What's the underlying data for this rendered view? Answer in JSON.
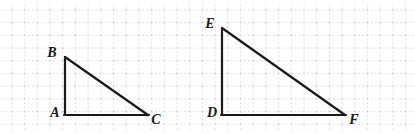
{
  "figure": {
    "width": 415,
    "height": 133,
    "background_color": "#ffffff"
  },
  "grid": {
    "name": "dotted-graph-paper",
    "style": "dotted",
    "line_color": "#b9b9b9",
    "spacing_px": 12.7,
    "offset_x_px": 11.5,
    "offset_y_px": 9.5,
    "visible": true
  },
  "stroke": {
    "color": "#1a1a1a",
    "width_px": 2.2,
    "linecap": "round",
    "linejoin": "miter"
  },
  "shapes": [
    {
      "name": "triangle-abc",
      "kind": "right-triangle",
      "right_angle_at": "A",
      "vertices": [
        {
          "label": "A",
          "x": 65,
          "y": 115,
          "label_x": 55,
          "label_y": 113
        },
        {
          "label": "B",
          "x": 65,
          "y": 57,
          "label_x": 52,
          "label_y": 53
        },
        {
          "label": "C",
          "x": 148,
          "y": 115,
          "label_x": 156,
          "label_y": 120
        }
      ],
      "edges": [
        {
          "name": "segment-ab",
          "from": "A",
          "to": "B"
        },
        {
          "name": "segment-bc",
          "from": "B",
          "to": "C"
        },
        {
          "name": "segment-ac",
          "from": "A",
          "to": "C"
        }
      ],
      "leg_vertical_px": 58,
      "leg_horizontal_px": 83
    },
    {
      "name": "triangle-def",
      "kind": "right-triangle",
      "right_angle_at": "D",
      "vertices": [
        {
          "label": "D",
          "x": 222,
          "y": 115,
          "label_x": 212,
          "label_y": 113
        },
        {
          "label": "E",
          "x": 222,
          "y": 28,
          "label_x": 210,
          "label_y": 24
        },
        {
          "label": "F",
          "x": 345,
          "y": 115,
          "label_x": 354,
          "label_y": 120
        }
      ],
      "edges": [
        {
          "name": "segment-de",
          "from": "D",
          "to": "E"
        },
        {
          "name": "segment-ef",
          "from": "E",
          "to": "F"
        },
        {
          "name": "segment-df",
          "from": "D",
          "to": "F"
        }
      ],
      "leg_vertical_px": 87,
      "leg_horizontal_px": 123
    }
  ],
  "labels": {
    "a": "A",
    "b": "B",
    "c": "C",
    "d": "D",
    "e": "E",
    "f": "F"
  }
}
